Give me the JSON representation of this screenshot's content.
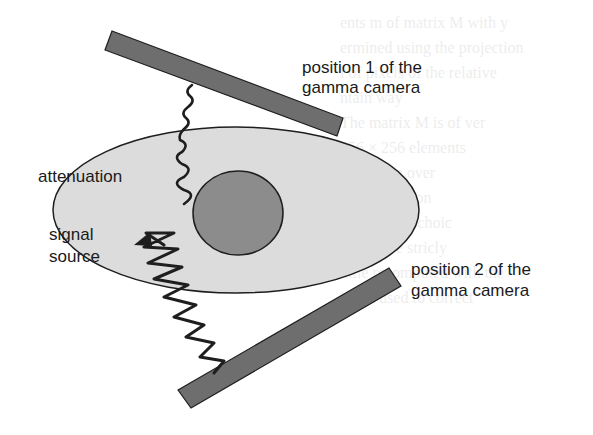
{
  "diagram": {
    "labels": {
      "camera_position_1": [
        "position 1 of the",
        "gamma camera"
      ],
      "camera_position_2": [
        "position 2 of the",
        "gamma camera"
      ],
      "attenuation": "attenuation",
      "signal_source": [
        "signal",
        "source"
      ]
    },
    "colors": {
      "body_fill": "#dcdcdc",
      "organ_fill": "#8c8c8c",
      "camera_fill": "#6e6e6e",
      "outline": "#1e1e1e",
      "wave": "#1e1e1e"
    },
    "bleed_through_text": [
      "ents m of matrix M with y",
      "ermined using the projection",
      "l of pixels of the relative",
      "ntain way",
      "The matrix M is of ver",
      "256 × 256 elements",
      "ould have over",
      "reconstruction",
      "transform, echoic",
      "Therefore stricly",
      "ntile recomputed with the",
      "is not used to correct"
    ]
  }
}
